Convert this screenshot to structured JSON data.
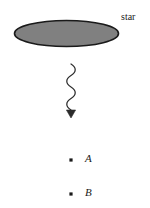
{
  "figure": {
    "title": "",
    "background_color": "#ffffff",
    "star": {
      "label": "star",
      "shape": "ellipse",
      "fill_color": "#808080",
      "stroke_color": "#1a1a1a",
      "center_x": 66.5,
      "center_y": 33.5,
      "radius_x": 52.5,
      "radius_y": 13.5
    },
    "ray": {
      "name": "wavy-ray",
      "style": "squiggle-with-arrowhead",
      "color": "#2b2b2b",
      "start_x": 71,
      "start_y": 64,
      "end_x": 71,
      "end_y": 118,
      "direction": "downward"
    },
    "points": [
      {
        "label": "A",
        "dot_x": 71,
        "dot_y": 160,
        "dot_color": "#1a1a1a",
        "label_x": 87,
        "label_y": 160
      },
      {
        "label": "B",
        "dot_x": 71,
        "dot_y": 194,
        "dot_color": "#1a1a1a",
        "label_x": 87,
        "label_y": 194
      }
    ]
  }
}
